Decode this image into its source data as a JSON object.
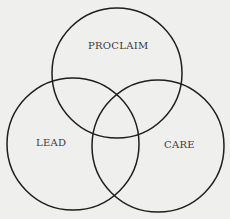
{
  "diagram": {
    "type": "venn",
    "stroke_color": "#1e1e1e",
    "background": "#efefed",
    "circles": [
      {
        "label": "PROCLAIM",
        "cx": 117,
        "cy": 73,
        "r": 66
      },
      {
        "label": "LEAD",
        "cx": 73,
        "cy": 144,
        "r": 66
      },
      {
        "label": "CARE",
        "cx": 158,
        "cy": 146,
        "r": 66
      }
    ]
  }
}
